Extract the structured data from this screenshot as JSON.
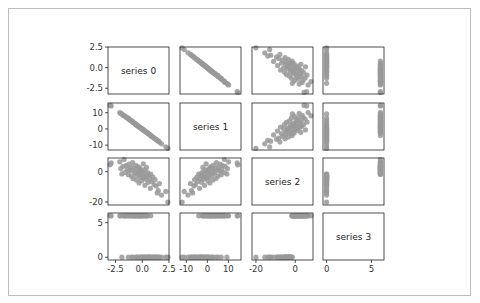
{
  "chart_data": {
    "type": "scatter",
    "subtype": "scatter_matrix",
    "title": "",
    "variables": [
      "series 0",
      "series 1",
      "series 2",
      "series 3"
    ],
    "diagonal": "label",
    "marker_color": "#999999",
    "axis_ranges": {
      "series 0": [
        -3.2,
        2.5
      ],
      "series 1": [
        -13,
        16
      ],
      "series 2": [
        -22,
        9
      ],
      "series 3": [
        -0.4,
        6.4
      ]
    },
    "ticks": {
      "series 0": {
        "values": [
          -2.5,
          0.0,
          2.5
        ],
        "labels": [
          "-2.5",
          "0.0",
          "2.5"
        ]
      },
      "series 1": {
        "values": [
          -10,
          0,
          10
        ],
        "labels": [
          "-10",
          "0",
          "10"
        ]
      },
      "series 2": {
        "values": [
          -20,
          0
        ],
        "labels": [
          "-20",
          "0"
        ]
      },
      "series 3": {
        "values": [
          0,
          5
        ],
        "labels": [
          "0",
          "5"
        ]
      }
    },
    "data": {
      "series 0": [
        -3.0,
        -2.9,
        -2.1,
        -2.0,
        -1.9,
        -1.8,
        -1.7,
        -1.6,
        -1.5,
        -1.4,
        -1.3,
        -1.25,
        -1.2,
        -1.1,
        -1.0,
        -0.95,
        -0.9,
        -0.85,
        -0.8,
        -0.7,
        -0.65,
        -0.6,
        -0.55,
        -0.5,
        -0.45,
        -0.4,
        -0.35,
        -0.3,
        -0.25,
        -0.2,
        -0.15,
        -0.1,
        -0.05,
        0.0,
        0.05,
        0.1,
        0.15,
        0.2,
        0.25,
        0.3,
        0.35,
        0.4,
        0.45,
        0.5,
        0.55,
        0.6,
        0.7,
        0.75,
        0.8,
        0.9,
        1.0,
        1.1,
        1.2,
        1.3,
        1.4,
        1.5,
        1.6,
        1.8,
        2.2,
        2.4
      ],
      "series 1": [
        14.5,
        14.2,
        10.1,
        9.6,
        9.3,
        8.4,
        8.1,
        7.9,
        7.2,
        6.8,
        6.6,
        6.1,
        5.9,
        5.2,
        5.0,
        4.9,
        4.3,
        4.1,
        3.8,
        3.5,
        3.1,
        2.7,
        2.6,
        2.3,
        2.1,
        1.8,
        1.6,
        1.2,
        1.1,
        0.9,
        0.6,
        0.4,
        0.2,
        -0.1,
        -0.3,
        -0.6,
        -0.8,
        -1.0,
        -1.3,
        -1.5,
        -1.9,
        -2.1,
        -2.2,
        -2.6,
        -2.8,
        -3.0,
        -3.6,
        -3.7,
        -4.1,
        -4.6,
        -5.0,
        -5.6,
        -6.1,
        -6.4,
        -7.0,
        -7.6,
        -8.0,
        -9.2,
        -11.0,
        -12.0
      ],
      "series 2": [
        4.5,
        5.8,
        6.5,
        2.0,
        -1.5,
        3.5,
        8.0,
        -0.5,
        4.0,
        1.5,
        -2.0,
        5.0,
        0.5,
        3.0,
        -3.0,
        1.0,
        6.0,
        -4.5,
        2.5,
        -1.0,
        0.0,
        4.2,
        -5.5,
        -2.5,
        1.8,
        -0.8,
        3.2,
        -7.5,
        -1.8,
        2.2,
        -3.8,
        0.8,
        -6.0,
        -0.2,
        -2.8,
        5.2,
        -4.0,
        1.2,
        -9.0,
        -1.2,
        -5.0,
        2.8,
        -3.2,
        -0.6,
        -7.0,
        -2.2,
        -4.8,
        -11.0,
        -1.6,
        -6.5,
        -3.5,
        -8.5,
        -5.2,
        -9.5,
        -14.0,
        -12.5,
        -7.8,
        -15.5,
        -13.0,
        -20.0
      ],
      "series 3": [
        6,
        6,
        6,
        6,
        0,
        6,
        6,
        6,
        6,
        6,
        0,
        6,
        6,
        6,
        0,
        6,
        6,
        0,
        6,
        6,
        6,
        6,
        0,
        0,
        6,
        6,
        6,
        0,
        6,
        6,
        0,
        6,
        0,
        6,
        0,
        6,
        0,
        6,
        0,
        6,
        0,
        6,
        0,
        6,
        0,
        0,
        0,
        0,
        6,
        0,
        0,
        0,
        0,
        0,
        0,
        0,
        0,
        0,
        0,
        0
      ]
    }
  }
}
